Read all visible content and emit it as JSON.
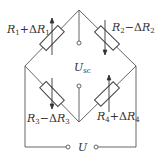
{
  "diagram": {
    "type": "wheatstone-bridge",
    "line_color": "#555555",
    "labels": {
      "r1": {
        "sym": "R",
        "sub": "1",
        "op": "+Δ",
        "sym2": "R",
        "sub2": "1"
      },
      "r2": {
        "sym": "R",
        "sub": "2",
        "op": "−Δ",
        "sym2": "R",
        "sub2": "2"
      },
      "r3": {
        "sym": "R",
        "sub": "3",
        "op": "−Δ",
        "sym2": "R",
        "sub2": "3"
      },
      "r4": {
        "sym": "R",
        "sub": "4",
        "op": "+Δ",
        "sym2": "R",
        "sub2": "4"
      },
      "usc": {
        "sym": "U",
        "sub": "sc"
      },
      "u": {
        "sym": "U"
      }
    }
  }
}
